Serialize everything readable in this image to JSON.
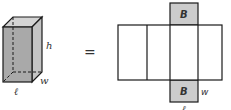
{
  "diagram": {
    "prism": {
      "height_label": "h",
      "width_label": "w",
      "length_label": "ℓ"
    },
    "equals_sign": "=",
    "net": {
      "top_base_label": "B",
      "bottom_base_label": "B",
      "width_label": "w",
      "length_label": "ℓ"
    },
    "colors": {
      "prism_front": "#a9a9a9",
      "prism_side": "#c4c4c4",
      "prism_top": "#d4d4d4",
      "base_fill": "#cccccc",
      "stroke": "#1a1a1a"
    }
  }
}
